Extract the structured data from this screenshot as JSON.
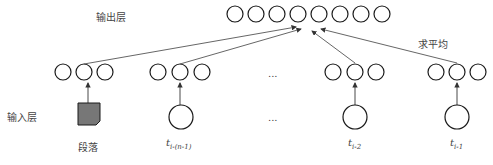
{
  "labels": {
    "output_layer": "输出层",
    "input_layer": "输入层",
    "average": "求平均",
    "ellipsis_mid": "...",
    "ellipsis_bottom": "...",
    "paragraph": "段落"
  },
  "inputs": [
    {
      "var": "t",
      "sub": "i-(n-1)"
    },
    {
      "var": "t",
      "sub": "i-2"
    },
    {
      "var": "t",
      "sub": "i-1"
    }
  ],
  "colors": {
    "stroke": "#1a1a1a",
    "paragraph_fill": "#777777",
    "arrow": "#555555"
  }
}
